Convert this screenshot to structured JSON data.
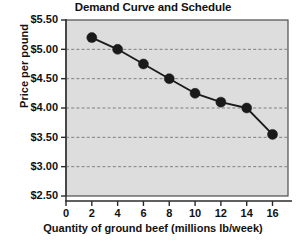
{
  "chart_data": {
    "type": "line",
    "title": "Demand Curve and Schedule",
    "xlabel": "Quantity of ground beef (millions lb/week)",
    "ylabel": "Price per pound",
    "x": [
      2,
      4,
      6,
      8,
      10,
      12,
      14,
      16
    ],
    "values": [
      5.2,
      5.0,
      4.75,
      4.5,
      4.25,
      4.1,
      4.0,
      3.55
    ],
    "series": [
      {
        "name": "Demand",
        "x": [
          2,
          4,
          6,
          8,
          10,
          12,
          14,
          16
        ],
        "values": [
          5.2,
          5.0,
          4.75,
          4.5,
          4.25,
          4.1,
          4.0,
          3.55
        ]
      }
    ],
    "xlim": [
      0,
      17.2
    ],
    "ylim": [
      2.5,
      5.5
    ],
    "xticks": [
      0,
      2,
      4,
      6,
      8,
      10,
      12,
      14,
      16
    ],
    "xtick_labels": [
      "0",
      "2",
      "4",
      "6",
      "8",
      "10",
      "12",
      "14",
      "16"
    ],
    "yticks": [
      2.5,
      3.0,
      3.5,
      4.0,
      4.5,
      5.0,
      5.5
    ],
    "ytick_labels": [
      "$2.50",
      "$3.00",
      "$3.50",
      "$4.00",
      "$4.50",
      "$5.00",
      "$5.50"
    ],
    "grid": "horizontal-dashed",
    "legend": "none",
    "colors": {
      "plot_background": "#dddddd",
      "plot_border": "#4d4d4d",
      "grid": "#808080",
      "line": "#1a1a1a",
      "marker": "#1a1a1a",
      "text": "#111111",
      "figure_background": "#ffffff"
    },
    "marker": "circle",
    "marker_size": 5
  }
}
